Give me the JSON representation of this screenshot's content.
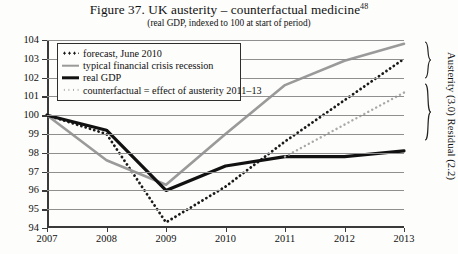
{
  "figure": {
    "title": "Figure 37. UK austerity – counterfactual medicine",
    "title_superscript": "48",
    "subtitle": "(real GDP, indexed to 100 at start of period)"
  },
  "legend": {
    "items": [
      {
        "label": "forecast, June 2010",
        "marker": "dotted-dark",
        "color": "#1a1a1a"
      },
      {
        "label": "typical financial crisis recession",
        "marker": "solid-gray",
        "color": "#9a9a9a"
      },
      {
        "label": "real GDP",
        "marker": "solid-black",
        "color": "#111111"
      },
      {
        "label": "counterfactual = effect of austerity 2011–13",
        "marker": "dotted-light",
        "color": "#a9a9a9"
      }
    ]
  },
  "annotations": {
    "side_label": "Austerity (3.0) Residual (2.2)",
    "brace_upper": "Residual (2.2)",
    "brace_lower": "Austerity (3.0)"
  },
  "chart_data": {
    "type": "line",
    "title": "Figure 37. UK austerity – counterfactual medicine",
    "subtitle": "(real GDP, indexed to 100 at start of period)",
    "xlabel": "",
    "ylabel": "",
    "x": [
      2007,
      2008,
      2009,
      2010,
      2011,
      2012,
      2013
    ],
    "xticks": [
      "2007",
      "2008",
      "2009",
      "2010",
      "2011",
      "2012",
      "2013"
    ],
    "yticks": [
      94,
      95,
      96,
      97,
      98,
      99,
      100,
      101,
      102,
      103,
      104
    ],
    "xlim": [
      2007,
      2013
    ],
    "ylim": [
      94,
      104
    ],
    "grid": true,
    "legend_position": "top-left",
    "series": [
      {
        "name": "forecast, June 2010",
        "style": "dotted",
        "color": "#1a1a1a",
        "values": [
          100.0,
          99.0,
          94.3,
          96.2,
          98.6,
          100.8,
          103.0
        ]
      },
      {
        "name": "typical financial crisis recession",
        "style": "solid",
        "color": "#9a9a9a",
        "values": [
          100.0,
          97.6,
          96.3,
          99.0,
          101.6,
          102.9,
          103.8
        ]
      },
      {
        "name": "real GDP",
        "style": "solid",
        "color": "#111111",
        "values": [
          100.0,
          99.2,
          96.0,
          97.3,
          97.8,
          97.8,
          98.1
        ]
      },
      {
        "name": "counterfactual = effect of austerity 2011–13",
        "style": "dotted",
        "color": "#a9a9a9",
        "values": [
          null,
          null,
          null,
          null,
          97.8,
          99.5,
          101.2
        ]
      }
    ]
  }
}
